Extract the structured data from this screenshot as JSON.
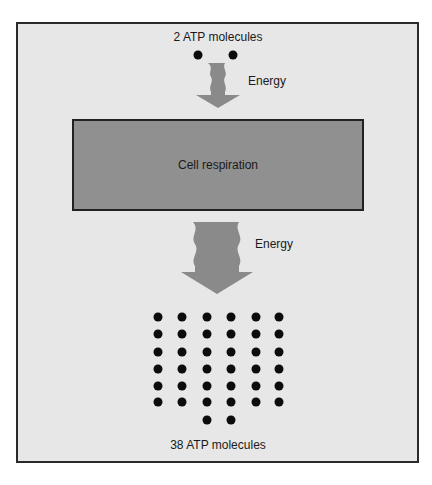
{
  "diagram": {
    "title": "",
    "colors": {
      "frame_background": "#e7e7e7",
      "frame_border": "#2a2a2a",
      "process_fill": "#909090",
      "arrow_fill": "#8a8a8a",
      "molecule_fill": "#0c0c0c",
      "text": "#1a1a1a"
    },
    "input": {
      "label": "2 ATP molecules",
      "count": 2
    },
    "arrow_in": {
      "label": "Energy",
      "icon": "wavy-down-arrow-icon",
      "size": "small"
    },
    "process": {
      "label": "Cell respiration"
    },
    "arrow_out": {
      "label": "Energy",
      "icon": "wavy-down-arrow-icon",
      "size": "large"
    },
    "output": {
      "label": "38 ATP molecules",
      "count": 38,
      "grid_columns": 6,
      "grid_rows": 6,
      "extra_row_count": 2
    }
  }
}
